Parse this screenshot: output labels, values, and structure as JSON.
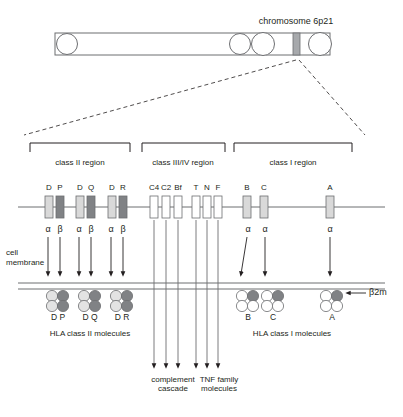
{
  "figure": {
    "title": "chromosome 6p21",
    "background": "#ffffff",
    "ink": "#231f20",
    "line": "#6d6e71",
    "band_color": "#a7a9ac",
    "gene_light": "#d9d9d9",
    "gene_dark": "#808285",
    "gene_white": "#ffffff",
    "mol_light": "#e3e3e3",
    "mol_dark": "#808285",
    "mol_white": "#ffffff"
  },
  "chromosome": {
    "label": "chromosome 6p21",
    "bar": {
      "x": 55,
      "y": 33,
      "width": 275,
      "height": 22
    },
    "circles": [
      {
        "cx": 67,
        "cy": 44,
        "r": 10.5
      },
      {
        "cx": 240,
        "cy": 44,
        "r": 10.5
      },
      {
        "cx": 263,
        "cy": 44,
        "r": 11.5
      },
      {
        "cx": 320,
        "cy": 44,
        "r": 11.5
      }
    ],
    "band": {
      "x": 293,
      "y": 33,
      "width": 7,
      "height": 22
    }
  },
  "projection": {
    "apex": {
      "x": 296,
      "y": 62
    },
    "left_end": {
      "x": 24,
      "y": 135
    },
    "right_end": {
      "x": 365,
      "y": 135
    }
  },
  "regions": [
    {
      "id": "class-ii",
      "label": "class II region",
      "x1": 30,
      "x2": 130,
      "label_x": 80,
      "label_y": 157
    },
    {
      "id": "class-iii-iv",
      "label": "class III/IV region",
      "x1": 142,
      "x2": 225,
      "label_x": 183,
      "label_y": 157
    },
    {
      "id": "class-i",
      "label": "class I region",
      "x1": 234,
      "x2": 352,
      "label_x": 293,
      "label_y": 157
    }
  ],
  "gene_axis": {
    "y": 207,
    "x1": 18,
    "x2": 385
  },
  "gene_loci": [
    {
      "id": "dp",
      "label_left": "D",
      "label_right": "P",
      "boxes": [
        {
          "x": 45,
          "fill": "light"
        },
        {
          "x": 56,
          "fill": "dark"
        }
      ],
      "label_y": 191,
      "chains": [
        {
          "text": "α",
          "x": 46.5
        },
        {
          "text": "β",
          "x": 58.5
        }
      ]
    },
    {
      "id": "dq",
      "label_left": "D",
      "label_right": "Q",
      "boxes": [
        {
          "x": 76,
          "fill": "light"
        },
        {
          "x": 87,
          "fill": "dark"
        }
      ],
      "label_y": 191,
      "chains": [
        {
          "text": "α",
          "x": 77.5
        },
        {
          "text": "β",
          "x": 89.5
        }
      ]
    },
    {
      "id": "dr",
      "label_left": "D",
      "label_right": "R",
      "boxes": [
        {
          "x": 108,
          "fill": "light"
        },
        {
          "x": 119,
          "fill": "dark"
        }
      ],
      "label_y": 191,
      "chains": [
        {
          "text": "α",
          "x": 109.5
        },
        {
          "text": "β",
          "x": 121.5
        }
      ]
    }
  ],
  "class_iii_genes": [
    {
      "label": "C4",
      "x": 154
    },
    {
      "label": "C2",
      "x": 166
    },
    {
      "label": "Bf",
      "x": 178
    },
    {
      "label": "T",
      "x": 196
    },
    {
      "label": "N",
      "x": 207
    },
    {
      "label": "F",
      "x": 218
    }
  ],
  "class_i_genes": [
    {
      "label": "B",
      "x": 247,
      "chain": "α"
    },
    {
      "label": "C",
      "x": 264,
      "chain": "α"
    },
    {
      "label": "A",
      "x": 330,
      "chain": "α"
    }
  ],
  "membrane": {
    "label_line1": "cell",
    "label_line2": "membrane",
    "label_x": 6,
    "label_y": 252,
    "y_top": 283,
    "y_bottom": 289,
    "x1": 18,
    "x2": 385
  },
  "class_ii_molecules": [
    {
      "label": "D P",
      "cx": 58,
      "label_y": 312
    },
    {
      "label": "D Q",
      "cx": 90,
      "label_y": 312
    },
    {
      "label": "D R",
      "cx": 122,
      "label_y": 312
    }
  ],
  "class_i_molecules": [
    {
      "label": "B",
      "cx": 248,
      "label_y": 312
    },
    {
      "label": "C",
      "cx": 273,
      "label_y": 312
    },
    {
      "label": "A",
      "cx": 332,
      "label_y": 312
    }
  ],
  "b2m": {
    "label": "β2m",
    "label_x": 370,
    "label_y": 292,
    "arrow_from_x": 368,
    "arrow_to_x": 345,
    "y": 295
  },
  "captions": [
    {
      "id": "hla-class-ii",
      "line1": "HLA class II molecules",
      "line2": "",
      "x": 90,
      "y": 334
    },
    {
      "id": "complement",
      "line1": "complement",
      "line2": "cascade",
      "x": 173,
      "y": 381
    },
    {
      "id": "tnf-family",
      "line1": "TNF family",
      "line2": "molecules",
      "x": 219,
      "y": 381
    },
    {
      "id": "hla-class-i",
      "line1": "HLA class I molecules",
      "line2": "",
      "x": 292,
      "y": 334
    }
  ],
  "descent_arrows": {
    "complement_x": [
      165,
      175,
      185
    ],
    "tnf_x": [
      203,
      213,
      223
    ],
    "y_top": 215,
    "y_bottom": 368
  }
}
